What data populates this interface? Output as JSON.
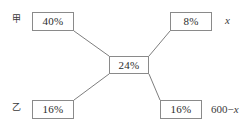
{
  "diagram": {
    "type": "alligation-cross-diagram",
    "line_color": "#6f6f6f",
    "box_border_color": "#8a8a8a",
    "text_color": "#2b2b2b",
    "background_color": "#ffffff",
    "row_labels": {
      "upper": "甲",
      "lower": "乙"
    },
    "variables": {
      "upper_right": "x",
      "lower_right_prefix": "600−",
      "lower_right_var": "x",
      "lower_right_full": "600−x"
    },
    "nodes": [
      {
        "id": "top-left",
        "value": "40%"
      },
      {
        "id": "top-right",
        "value": "8%"
      },
      {
        "id": "center",
        "value": "24%"
      },
      {
        "id": "bottom-left",
        "value": "16%"
      },
      {
        "id": "bottom-right",
        "value": "16%"
      }
    ],
    "connections": [
      {
        "from": "top-left",
        "to": "center"
      },
      {
        "from": "top-right",
        "to": "center"
      },
      {
        "from": "bottom-left",
        "to": "center"
      },
      {
        "from": "bottom-right",
        "to": "center"
      }
    ]
  }
}
